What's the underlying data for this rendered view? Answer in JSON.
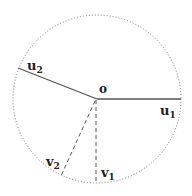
{
  "diagram": {
    "circle": {
      "cx": 97,
      "cy": 99,
      "r": 84,
      "style": "dotted"
    },
    "origin": {
      "label": "o",
      "x": 97,
      "y": 99
    },
    "vectors": [
      {
        "id": "u1",
        "label": "u",
        "sub": "1",
        "end": [
          181,
          99
        ],
        "style": "solid"
      },
      {
        "id": "u2",
        "label": "u",
        "sub": "2",
        "end": [
          18,
          68
        ],
        "style": "solid"
      },
      {
        "id": "v1",
        "label": "v",
        "sub": "1",
        "end": [
          96,
          184
        ],
        "style": "dashed"
      },
      {
        "id": "v2",
        "label": "v",
        "sub": "2",
        "end": [
          61,
          176
        ],
        "style": "dashed"
      }
    ]
  }
}
